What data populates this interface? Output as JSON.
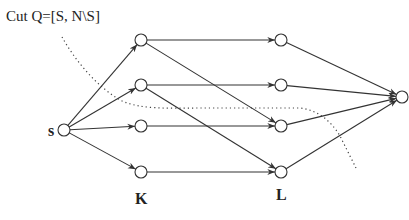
{
  "title": "Cut Q=[S, N\\S]",
  "labels": {
    "source": "s",
    "sink": "t",
    "left_set": "K",
    "right_set": "L"
  },
  "colors": {
    "stroke": "#333333",
    "background": "#ffffff"
  },
  "nodes": [
    {
      "id": "s",
      "x": 64,
      "y": 130
    },
    {
      "id": "k1",
      "x": 141,
      "y": 40
    },
    {
      "id": "k2",
      "x": 141,
      "y": 85
    },
    {
      "id": "k3",
      "x": 141,
      "y": 126
    },
    {
      "id": "k4",
      "x": 141,
      "y": 172
    },
    {
      "id": "l1",
      "x": 281,
      "y": 40
    },
    {
      "id": "l2",
      "x": 281,
      "y": 85
    },
    {
      "id": "l3",
      "x": 281,
      "y": 126
    },
    {
      "id": "l4",
      "x": 281,
      "y": 172
    },
    {
      "id": "t",
      "x": 402,
      "y": 97
    }
  ],
  "edges": [
    [
      "s",
      "k1"
    ],
    [
      "s",
      "k2"
    ],
    [
      "s",
      "k3"
    ],
    [
      "s",
      "k4"
    ],
    [
      "k1",
      "l1"
    ],
    [
      "k1",
      "l3"
    ],
    [
      "k2",
      "l2"
    ],
    [
      "k2",
      "l4"
    ],
    [
      "k3",
      "l3"
    ],
    [
      "k4",
      "l4"
    ],
    [
      "l1",
      "t"
    ],
    [
      "l2",
      "t"
    ],
    [
      "l3",
      "t"
    ],
    [
      "l4",
      "t"
    ]
  ]
}
